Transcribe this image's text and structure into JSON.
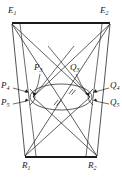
{
  "figure": {
    "name": "projective-geometry-diagram",
    "background_color": "#ffffff",
    "stroke_color": "#1a1a1a",
    "labels": {
      "e1": {
        "base": "E",
        "sub": "1",
        "x": 8,
        "y": 9
      },
      "e2": {
        "base": "E",
        "sub": "2",
        "x": 100,
        "y": 9
      },
      "p3": {
        "base": "P",
        "sub": "3",
        "x": 35,
        "y": 65
      },
      "q3": {
        "base": "Q",
        "sub": "3",
        "x": 69,
        "y": 65
      },
      "p4": {
        "base": "P",
        "sub": "4",
        "x": 2,
        "y": 83
      },
      "q4": {
        "base": "Q",
        "sub": "4",
        "x": 104,
        "y": 83
      },
      "p5": {
        "base": "P",
        "sub": "5",
        "x": 2,
        "y": 100
      },
      "q5": {
        "base": "Q",
        "sub": "5",
        "x": 104,
        "y": 100
      },
      "r1": {
        "base": "R",
        "sub": "1",
        "x": 22,
        "y": 163
      },
      "r2": {
        "base": "R",
        "sub": "2",
        "x": 88,
        "y": 163
      }
    },
    "geometry": {
      "top_bar": {
        "x1": 12,
        "y1": 23,
        "x2": 110,
        "y2": 23
      },
      "bottom_bar": {
        "x1": 25,
        "y1": 157,
        "x2": 97,
        "y2": 157
      },
      "ellipse": {
        "cx": 61,
        "cy": 97,
        "rx": 31,
        "ry": 13
      },
      "p_node": {
        "x": 33,
        "y": 97
      },
      "q_node": {
        "x": 90,
        "y": 97
      },
      "hatch_marks": [
        {
          "x": 56,
          "y": 103
        },
        {
          "x": 71,
          "y": 92
        }
      ]
    }
  }
}
